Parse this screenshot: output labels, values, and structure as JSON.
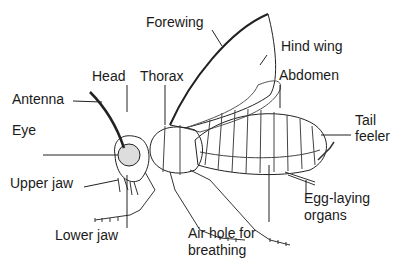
{
  "diagram": {
    "labels": {
      "forewing": "Forewing",
      "hind_wing": "Hind wing",
      "head": "Head",
      "thorax": "Thorax",
      "abdomen": "Abdomen",
      "antenna": "Antenna",
      "eye": "Eye",
      "tail_feeler_1": "Tail",
      "tail_feeler_2": "feeler",
      "upper_jaw": "Upper jaw",
      "lower_jaw": "Lower jaw",
      "air_hole_1": "Air hole for",
      "air_hole_2": "breathing",
      "egg_laying_1": "Egg-laying",
      "egg_laying_2": "organs"
    },
    "colors": {
      "line": "#222222",
      "text": "#1a1a1a",
      "background": "#ffffff"
    }
  }
}
